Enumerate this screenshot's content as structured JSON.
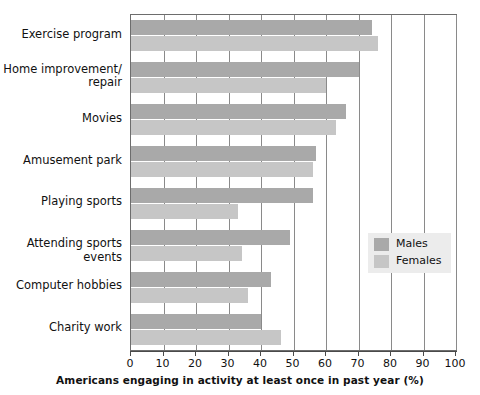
{
  "chart_data": {
    "type": "bar",
    "orientation": "horizontal",
    "title": "",
    "xlabel": "Americans engaging in activity at least once in past year (%)",
    "ylabel": "",
    "xlim": [
      0,
      100
    ],
    "xticks": [
      0,
      10,
      20,
      30,
      40,
      50,
      60,
      70,
      80,
      90,
      100
    ],
    "grid": true,
    "grid_axis": "x",
    "legend_position": "center-right",
    "categories": [
      "Exercise program",
      "Home improvement/\nrepair",
      "Movies",
      "Amusement park",
      "Playing sports",
      "Attending sports events",
      "Computer hobbies",
      "Charity work"
    ],
    "series": [
      {
        "name": "Males",
        "color": "#a9a9a9",
        "values": [
          74,
          70,
          66,
          57,
          56,
          49,
          43,
          40
        ]
      },
      {
        "name": "Females",
        "color": "#c6c6c6",
        "values": [
          76,
          60,
          63,
          56,
          33,
          34,
          36,
          46
        ]
      }
    ]
  },
  "axis": {
    "x_title": "Americans engaging in activity at least once in past year (%)",
    "tick_labels": [
      "0",
      "10",
      "20",
      "30",
      "40",
      "50",
      "60",
      "70",
      "80",
      "90",
      "100"
    ]
  },
  "categories": [
    {
      "line1": "Exercise program",
      "line2": ""
    },
    {
      "line1": "Home improvement/",
      "line2": "repair"
    },
    {
      "line1": "Movies",
      "line2": ""
    },
    {
      "line1": "Amusement park",
      "line2": ""
    },
    {
      "line1": "Playing sports",
      "line2": ""
    },
    {
      "line1": "Attending sports events",
      "line2": ""
    },
    {
      "line1": "Computer hobbies",
      "line2": ""
    },
    {
      "line1": "Charity work",
      "line2": ""
    }
  ],
  "legend": {
    "items": [
      {
        "label": "Males",
        "color": "#a9a9a9"
      },
      {
        "label": "Females",
        "color": "#c6c6c6"
      }
    ]
  }
}
